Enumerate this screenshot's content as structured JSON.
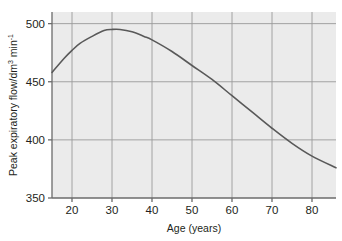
{
  "chart_data": {
    "type": "line",
    "title": "",
    "xlabel": "Age (years)",
    "ylabel": "Peak expiratory flow/dm",
    "ylabel_sup1": "3",
    "ylabel_mid": " min",
    "ylabel_sup2": "-1",
    "xlim": [
      15,
      86
    ],
    "ylim": [
      350,
      510
    ],
    "xticks": [
      20,
      30,
      40,
      50,
      60,
      70,
      80
    ],
    "yticks": [
      350,
      400,
      450,
      500
    ],
    "xtick_labels": [
      "20",
      "30",
      "40",
      "50",
      "60",
      "70",
      "80"
    ],
    "ytick_labels": [
      "350",
      "400",
      "450",
      "500"
    ],
    "grid": true,
    "legend": "none",
    "series": [
      {
        "name": "Peak expiratory flow",
        "x": [
          15,
          18,
          20,
          22,
          25,
          28,
          30,
          32,
          35,
          38,
          40,
          45,
          50,
          55,
          60,
          65,
          70,
          75,
          80,
          86
        ],
        "values": [
          458,
          470,
          477,
          483,
          489,
          494,
          495,
          495,
          493,
          489,
          486,
          476,
          464,
          452,
          438,
          424,
          410,
          397,
          386,
          376
        ],
        "color": "#595959"
      }
    ],
    "plot_background": "#ebebeb",
    "grid_color": "#9a9a9a",
    "axis_color": "#6b6b6b",
    "page_background": "#ffffff"
  }
}
